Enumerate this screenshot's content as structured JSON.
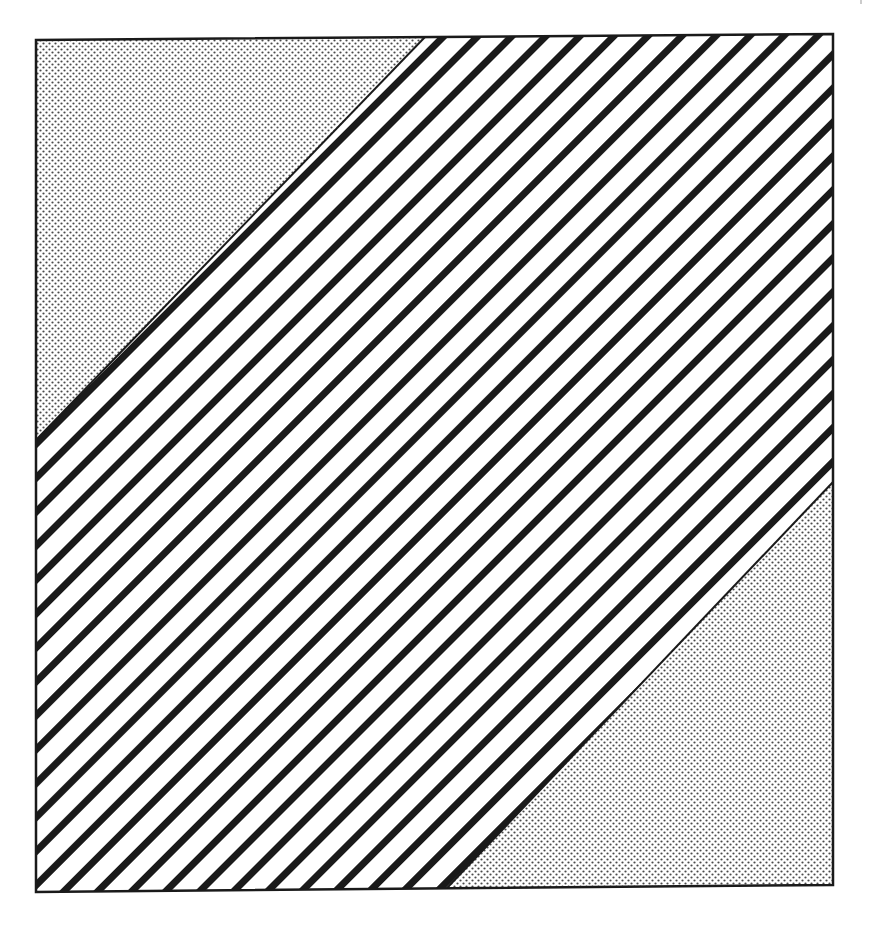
{
  "figure": {
    "regions": [
      {
        "name": "upper-left-dotted-triangle",
        "fill": "dots"
      },
      {
        "name": "diagonal-striped-band",
        "fill": "stripes"
      },
      {
        "name": "lower-right-dotted-triangle",
        "fill": "dots"
      }
    ],
    "colors": {
      "ink": "#1a1a1a",
      "paper": "#ffffff",
      "dot": "#555555"
    }
  }
}
